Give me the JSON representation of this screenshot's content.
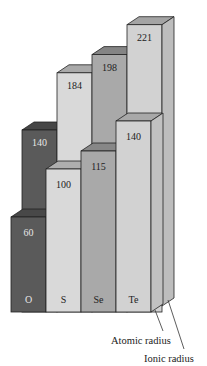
{
  "chart_data": {
    "type": "bar",
    "subtype": "3d-grouped-bar",
    "title": "",
    "xlabel": "",
    "ylabel": "",
    "categories": [
      "O",
      "S",
      "Se",
      "Te"
    ],
    "series": [
      {
        "name": "Atomic radius",
        "values": [
          140,
          184,
          198,
          221
        ],
        "row": "back"
      },
      {
        "name": "Ionic radius",
        "values": [
          60,
          100,
          115,
          140
        ],
        "row": "front"
      }
    ],
    "ylim": [
      0,
      230
    ],
    "grid": false,
    "legend": "bottom-right",
    "colors": {
      "O": "#5a5a5a",
      "S": "#d9d9d9",
      "Se": "#a9a9a9",
      "Te": "#d2d2d2"
    }
  }
}
